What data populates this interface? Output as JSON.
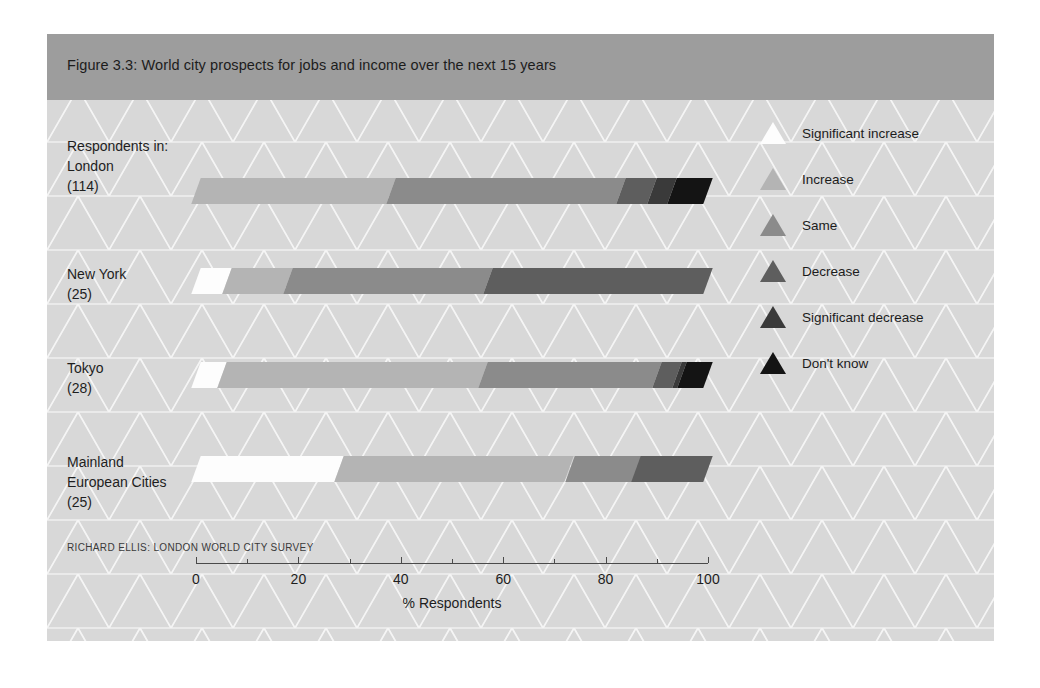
{
  "figure": {
    "title": "Figure 3.3: World city prospects for jobs and income over the next 15 years",
    "source": "RICHARD ELLIS: LONDON WORLD CITY SURVEY",
    "intro_label": "Respondents in:"
  },
  "colors": {
    "frame_background": "#d8d8d8",
    "header_band": "#9d9d9d",
    "axis": "#4a4a4a",
    "text": "#1e1e1e",
    "significant_increase": "#fdfdfd",
    "increase": "#b4b4b4",
    "same": "#8b8b8b",
    "decrease": "#5e5e5e",
    "significant_decrease": "#3a3a3a",
    "dont_know": "#141414"
  },
  "legend": {
    "position": "right",
    "items": [
      {
        "label": "Significant increase",
        "color": "#fdfdfd"
      },
      {
        "label": "Increase",
        "color": "#b4b4b4"
      },
      {
        "label": "Same",
        "color": "#8b8b8b"
      },
      {
        "label": "Decrease",
        "color": "#5e5e5e"
      },
      {
        "label": "Significant decrease",
        "color": "#3a3a3a"
      },
      {
        "label": "Don't know",
        "color": "#141414"
      }
    ]
  },
  "chart_data": {
    "type": "bar",
    "orientation": "horizontal",
    "stacked": true,
    "title": "Figure 3.3: World city prospects for jobs and income over the next 15 years",
    "xlabel": "% Respondents",
    "ylabel": "",
    "xlim": [
      0,
      100
    ],
    "xticks": [
      0,
      20,
      40,
      60,
      80,
      100
    ],
    "xtick_labels": [
      "0",
      "20",
      "40",
      "60",
      "80",
      "100"
    ],
    "grid": false,
    "legend_position": "right",
    "categories": [
      "London",
      "New York",
      "Tokyo",
      "Mainland European Cities"
    ],
    "category_labels": [
      {
        "name": "London",
        "n": "(114)",
        "lines": [
          "London"
        ]
      },
      {
        "name": "New York",
        "n": "(25)",
        "lines": [
          "New York"
        ]
      },
      {
        "name": "Tokyo",
        "n": "(28)",
        "lines": [
          "Tokyo"
        ]
      },
      {
        "name": "Mainland European Cities",
        "n": "(25)",
        "lines": [
          "Mainland",
          "European Cities"
        ]
      }
    ],
    "series": [
      {
        "name": "Significant increase",
        "color": "#fdfdfd",
        "values": [
          0,
          6,
          5,
          28
        ]
      },
      {
        "name": "Increase",
        "color": "#b4b4b4",
        "values": [
          38,
          12,
          51,
          45
        ]
      },
      {
        "name": "Same",
        "color": "#8b8b8b",
        "values": [
          45,
          39,
          34,
          13
        ]
      },
      {
        "name": "Decrease",
        "color": "#5e5e5e",
        "values": [
          6,
          43,
          4,
          14
        ]
      },
      {
        "name": "Significant decrease",
        "color": "#3a3a3a",
        "values": [
          4,
          0,
          1,
          0
        ]
      },
      {
        "name": "Don't know",
        "color": "#141414",
        "values": [
          7,
          0,
          5,
          0
        ]
      }
    ]
  }
}
